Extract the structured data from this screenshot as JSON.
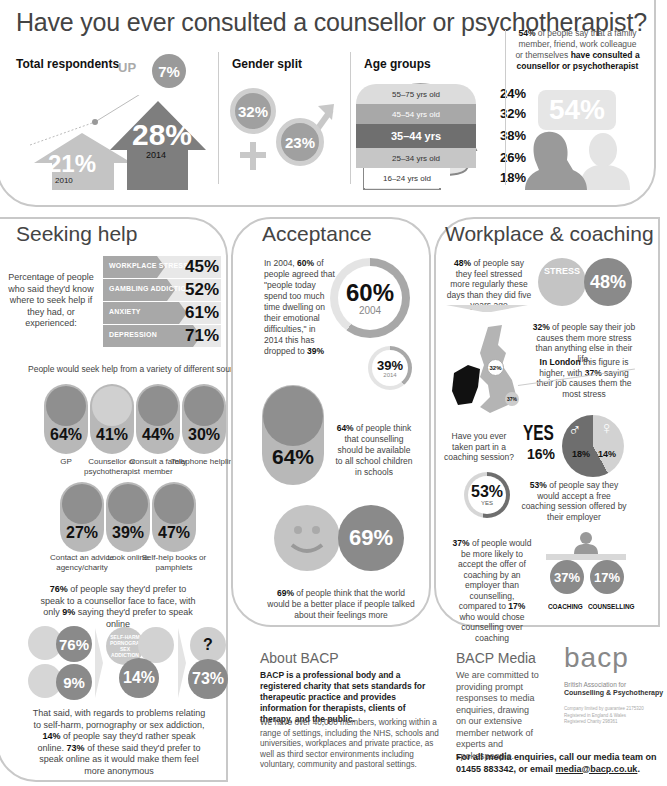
{
  "main_title": "Have you ever consulted a counsellor or psychotherapist?",
  "total_respondents": {
    "header": "Total respondents",
    "up_label": "UP",
    "up_value": "7%",
    "y2010_value": "21%",
    "y2010_label": "2010",
    "y2014_value": "28%",
    "y2014_label": "2014"
  },
  "gender_split": {
    "header": "Gender split",
    "female": "32%",
    "male": "23%"
  },
  "age_groups": {
    "header": "Age groups",
    "rows": [
      {
        "label": "55–75 yrs old",
        "value": "24%"
      },
      {
        "label": "45–54 yrs old",
        "value": "32%"
      },
      {
        "label": "35–44 yrs",
        "value": "38%"
      },
      {
        "label": "25–34 yrs old",
        "value": "26%"
      },
      {
        "label": "16–24 yrs old",
        "value": "18%"
      }
    ]
  },
  "consulted": {
    "pct_bold": "54%",
    "text_1": " of people say that a family member, friend, work colleague or themselves ",
    "text_bold": "have consulted a counsellor or psychotherapist",
    "bubble": "54%"
  },
  "seeking_help": {
    "title": "Seeking help",
    "intro": "Percentage of people who said they'd know where to seek help if they had, or experienced:",
    "bars": [
      {
        "label": "WORKPLACE STRESS",
        "value": "45%",
        "width": 62
      },
      {
        "label": "GAMBLING ADDICTION",
        "value": "52%",
        "width": 72
      },
      {
        "label": "ANXIETY",
        "value": "61%",
        "width": 84
      },
      {
        "label": "DEPRESSION",
        "value": "71%",
        "width": 98
      }
    ],
    "sources_intro": "People would seek help from a variety of different sources:",
    "sources_row1": [
      {
        "value": "64%",
        "label": "GP",
        "icon": "first-aid-kit-icon"
      },
      {
        "value": "41%",
        "label": "Counsellor or psychotherapist",
        "icon": "two-people-icon"
      },
      {
        "value": "44%",
        "label": "Consult a family member",
        "icon": "family-icon"
      },
      {
        "value": "30%",
        "label": "Telephone helpline",
        "icon": "telephone-icon"
      }
    ],
    "sources_row2": [
      {
        "value": "27%",
        "label": "Contact an advice agency/charity",
        "icon": "charity-hand-icon"
      },
      {
        "value": "39%",
        "label": "Look online",
        "icon": "laptop-icon"
      },
      {
        "value": "47%",
        "label": "Self-help books or pamphlets",
        "icon": "books-icon"
      }
    ],
    "face_text_pct1": "76%",
    "face_text_1": " of people say they'd prefer to speak to a counsellor face to face, with only ",
    "face_text_pct2": "9%",
    "face_text_2": " saying they'd prefer to speak online",
    "flow": {
      "face": "76%",
      "online": "9%",
      "topics_label": "SELF-HARM PORNOGRAPHY SEX ADDICTION",
      "topics_value": "14%",
      "anon_value": "73%",
      "question_mark": "?"
    },
    "closing_1": "That said, with regards to problems relating to self-harm, pornography or sex addiction, ",
    "closing_pct1": "14%",
    "closing_2": " of people say they'd rather speak online. ",
    "closing_pct2": "73%",
    "closing_3": " of these said they'd prefer to speak online as it would make them feel more anonymous"
  },
  "acceptance": {
    "title": "Acceptance",
    "text_1": "In 2004, ",
    "text_pct1": "60%",
    "text_2": " of people agreed that \"people today spend too much time dwelling on their emotional difficulties,\" in 2014 this has dropped to ",
    "text_pct2": "39%",
    "ring_2004_value": "60%",
    "ring_2004_label": "2004",
    "ring_2014_value": "39%",
    "ring_2014_label": "2014",
    "school_value": "64%",
    "school_pct": "64%",
    "school_text": " of people think that counselling should be available to all school children in schools",
    "world_value": "69%",
    "world_pct": "69%",
    "world_text": " of people think that the world would be a better place if people talked about their feelings more"
  },
  "workplace": {
    "title": "Workplace & coaching",
    "stress_pct": "48%",
    "stress_text": " of people say they feel stressed more regularly these days than they did five years ago",
    "stress_badge": "STRESS",
    "stress_value": "48%",
    "job_pct": "32%",
    "job_text": " of people say their job causes them more stress than anything else in their life.",
    "london_bold": "In London",
    "london_text_1": " this figure is higher, with ",
    "london_pct": "37%",
    "london_text_2": " saying their job causes them the most stress",
    "map_uk": "32%",
    "map_london": "37%",
    "coaching_q": "Have you ever taken part in a coaching session?",
    "yes_label": "YES",
    "yes_value": "16%",
    "male_value": "18%",
    "female_value": "14%",
    "accept_value": "53%",
    "accept_label": "YES",
    "accept_pct": "53%",
    "accept_text": " of people say they would accept a free coaching session offered by their employer",
    "pref_pct1": "37%",
    "pref_text_1": " of people would be more likely to accept the offer of coaching by an employer than counselling, compared to ",
    "pref_pct2": "17%",
    "pref_text_2": " who would chose counselling over coaching",
    "coaching_value": "37%",
    "counselling_value": "17%",
    "coaching_label": "COACHING",
    "counselling_label": "COUNSELLING"
  },
  "about": {
    "title": "About BACP",
    "bold": "BACP is a professional body and a registered charity that sets standards for therapeutic practice and provides information for therapists, clients of therapy, and the public.",
    "body": "We have over 40,000 members, working within a range of settings, including the NHS, schools and universities, workplaces and private practice, as well as third sector environments including voluntary, community and pastoral settings."
  },
  "media": {
    "title": "BACP Media",
    "body": "We are committed to providing prompt responses to media enquiries, drawing on our extensive member network of experts and spokespeople.",
    "contact_1": "For all media enquiries, call our media team on 01455 883342, or email ",
    "email": "media@bacp.co.uk",
    "contact_2": "."
  },
  "logo": {
    "wordmark": "bacp",
    "line1": "British Association for",
    "line2": "Counselling & Psychotherapy",
    "legal1": "Company limited by guarantee 2175320",
    "legal2": "Registered in England & Wales",
    "legal3": "Registered Charity 298361"
  },
  "colors": {
    "light_gray": "#d8d8d8",
    "mid_gray": "#b5b5b5",
    "dark_gray": "#8a8a8a",
    "border": "#c8c8c8",
    "text": "#444444"
  }
}
